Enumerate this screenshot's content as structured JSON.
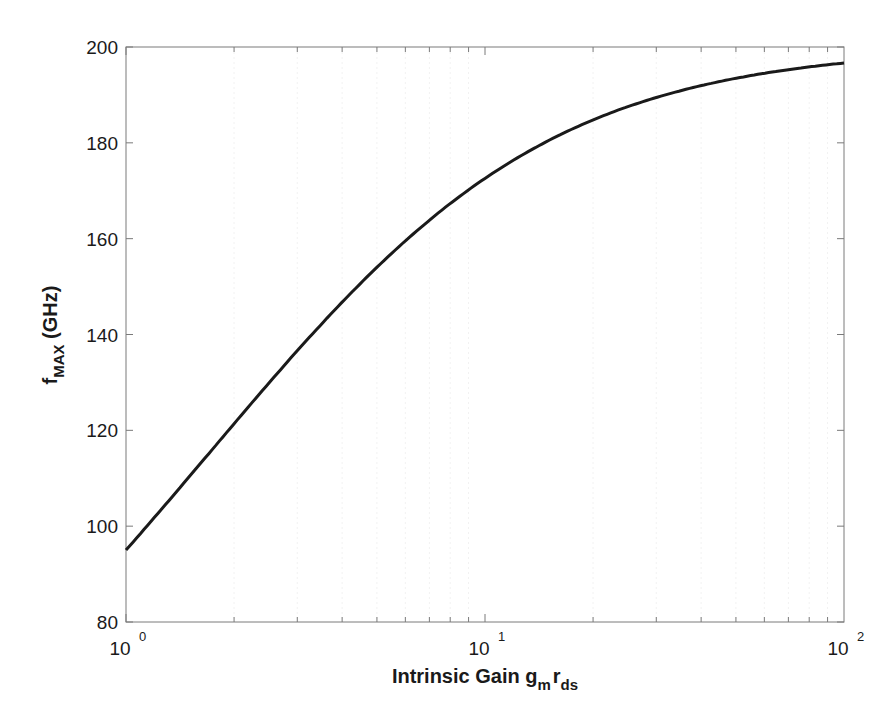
{
  "chart_data": {
    "type": "line",
    "title": "",
    "xlabel": "Intrinsic Gain g_m r_ds",
    "xlabel_parts": {
      "main": "Intrinsic Gain g",
      "sub1": "m",
      "mid": "r",
      "sub2": "ds"
    },
    "ylabel": "f_MAX (GHz)",
    "ylabel_parts": {
      "main": "f",
      "sub": "MAX",
      "rest": " (GHz)"
    },
    "xscale": "log",
    "xlim": [
      1,
      100
    ],
    "ylim": [
      80,
      200
    ],
    "grid": true,
    "legend": null,
    "x_ticks": [
      {
        "base": "10",
        "exp": "0",
        "value": 1
      },
      {
        "base": "10",
        "exp": "1",
        "value": 10
      },
      {
        "base": "10",
        "exp": "2",
        "value": 100
      }
    ],
    "y_ticks": [
      "80",
      "100",
      "120",
      "140",
      "160",
      "180",
      "200"
    ],
    "series": [
      {
        "name": "fMAX",
        "color": "#1a1a1a",
        "x": [
          1,
          1.5,
          2,
          3,
          4,
          5,
          7,
          10,
          15,
          20,
          30,
          40,
          50,
          70,
          100
        ],
        "values": [
          95.2,
          110.6,
          121.4,
          136.5,
          146.8,
          154.2,
          164.1,
          172.6,
          180.2,
          184.6,
          189.4,
          191.8,
          193.4,
          195.2,
          196.7
        ]
      }
    ]
  }
}
